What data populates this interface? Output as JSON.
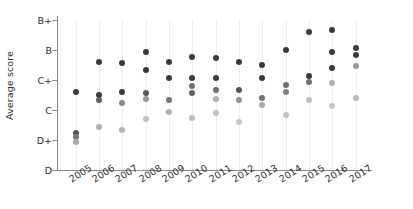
{
  "chart_data": {
    "type": "scatter",
    "title": "",
    "xlabel": "",
    "ylabel": "Average score",
    "grid": "vertical-dotted",
    "legend": "none",
    "ytick_labels": [
      "B+",
      "B",
      "C+",
      "C",
      "D+",
      "D"
    ],
    "ylim_labels": [
      "D",
      "B+"
    ],
    "categories": [
      "2005",
      "2006",
      "2007",
      "2008",
      "2009",
      "2010",
      "2011",
      "2012",
      "2013",
      "2014",
      "2015",
      "2016",
      "2017"
    ],
    "series": [
      {
        "name": "2005",
        "points": [
          {
            "score": "C",
            "value": 2.6,
            "shade": "#3a3a3a"
          },
          {
            "score": "D+",
            "value": 1.22,
            "shade": "#555555"
          },
          {
            "score": "D+",
            "value": 1.1,
            "shade": "#777777"
          },
          {
            "score": "D+",
            "value": 0.92,
            "shade": "#aaaaaa"
          }
        ]
      },
      {
        "name": "2006",
        "points": [
          {
            "score": "C+",
            "value": 3.58,
            "shade": "#3a3a3a"
          },
          {
            "score": "C",
            "value": 2.5,
            "shade": "#3a3a3a"
          },
          {
            "score": "C",
            "value": 2.32,
            "shade": "#606060"
          },
          {
            "score": "D+",
            "value": 1.42,
            "shade": "#b0b0b0"
          }
        ]
      },
      {
        "name": "2007",
        "points": [
          {
            "score": "C+",
            "value": 3.55,
            "shade": "#3a3a3a"
          },
          {
            "score": "C",
            "value": 2.6,
            "shade": "#3a3a3a"
          },
          {
            "score": "C",
            "value": 2.22,
            "shade": "#8a8a8a"
          },
          {
            "score": "D+",
            "value": 1.32,
            "shade": "#b5b5b5"
          }
        ]
      },
      {
        "name": "2008",
        "points": [
          {
            "score": "B",
            "value": 3.92,
            "shade": "#3a3a3a"
          },
          {
            "score": "C+",
            "value": 3.32,
            "shade": "#3a3a3a"
          },
          {
            "score": "C",
            "value": 2.55,
            "shade": "#555555"
          },
          {
            "score": "C",
            "value": 2.35,
            "shade": "#9a9a9a"
          },
          {
            "score": "C",
            "value": 1.68,
            "shade": "#c0c0c0"
          }
        ]
      },
      {
        "name": "2009",
        "points": [
          {
            "score": "C+",
            "value": 3.58,
            "shade": "#3a3a3a"
          },
          {
            "score": "C+",
            "value": 3.05,
            "shade": "#3a3a3a"
          },
          {
            "score": "C",
            "value": 2.32,
            "shade": "#777777"
          },
          {
            "score": "C",
            "value": 1.92,
            "shade": "#b0b0b0"
          }
        ]
      },
      {
        "name": "2010",
        "points": [
          {
            "score": "C+",
            "value": 3.75,
            "shade": "#3a3a3a"
          },
          {
            "score": "C+",
            "value": 3.05,
            "shade": "#3a3a3a"
          },
          {
            "score": "C+",
            "value": 2.78,
            "shade": "#707070"
          },
          {
            "score": "C",
            "value": 2.55,
            "shade": "#606060"
          },
          {
            "score": "C",
            "value": 1.72,
            "shade": "#bbbbbb"
          }
        ]
      },
      {
        "name": "2011",
        "points": [
          {
            "score": "C+",
            "value": 3.72,
            "shade": "#3a3a3a"
          },
          {
            "score": "C+",
            "value": 3.05,
            "shade": "#3a3a3a"
          },
          {
            "score": "C",
            "value": 2.65,
            "shade": "#707070"
          },
          {
            "score": "C",
            "value": 2.35,
            "shade": "#b0b0b0"
          },
          {
            "score": "C",
            "value": 1.88,
            "shade": "#c0c0c0"
          }
        ]
      },
      {
        "name": "2012",
        "points": [
          {
            "score": "C+",
            "value": 3.58,
            "shade": "#3a3a3a"
          },
          {
            "score": "C",
            "value": 2.65,
            "shade": "#555555"
          },
          {
            "score": "C",
            "value": 2.32,
            "shade": "#959595"
          },
          {
            "score": "D+",
            "value": 1.58,
            "shade": "#c5c5c5"
          }
        ]
      },
      {
        "name": "2013",
        "points": [
          {
            "score": "C+",
            "value": 3.48,
            "shade": "#3a3a3a"
          },
          {
            "score": "C+",
            "value": 3.05,
            "shade": "#3a3a3a"
          },
          {
            "score": "C",
            "value": 2.38,
            "shade": "#757575"
          },
          {
            "score": "C",
            "value": 2.15,
            "shade": "#aaaaaa"
          }
        ]
      },
      {
        "name": "2014",
        "points": [
          {
            "score": "B",
            "value": 3.98,
            "shade": "#3a3a3a"
          },
          {
            "score": "C+",
            "value": 2.82,
            "shade": "#707070"
          },
          {
            "score": "C+",
            "value": 2.58,
            "shade": "#808080"
          },
          {
            "score": "C",
            "value": 1.82,
            "shade": "#c5c5c5"
          }
        ]
      },
      {
        "name": "2015",
        "points": [
          {
            "score": "B+",
            "value": 4.58,
            "shade": "#3a3a3a"
          },
          {
            "score": "C+",
            "value": 3.12,
            "shade": "#3a3a3a"
          },
          {
            "score": "C+",
            "value": 2.92,
            "shade": "#707070"
          },
          {
            "score": "C",
            "value": 2.32,
            "shade": "#c0c0c0"
          }
        ]
      },
      {
        "name": "2016",
        "points": [
          {
            "score": "B+",
            "value": 4.65,
            "shade": "#3a3a3a"
          },
          {
            "score": "B",
            "value": 3.92,
            "shade": "#3a3a3a"
          },
          {
            "score": "C+",
            "value": 3.38,
            "shade": "#3a3a3a"
          },
          {
            "score": "C+",
            "value": 2.88,
            "shade": "#b0b0b0"
          },
          {
            "score": "C",
            "value": 2.12,
            "shade": "#c5c5c5"
          }
        ]
      },
      {
        "name": "2017",
        "points": [
          {
            "score": "B",
            "value": 4.05,
            "shade": "#3a3a3a"
          },
          {
            "score": "B",
            "value": 3.82,
            "shade": "#3a3a3a"
          },
          {
            "score": "C+",
            "value": 3.45,
            "shade": "#999999"
          },
          {
            "score": "C",
            "value": 2.38,
            "shade": "#bbbbbb"
          }
        ]
      }
    ]
  }
}
